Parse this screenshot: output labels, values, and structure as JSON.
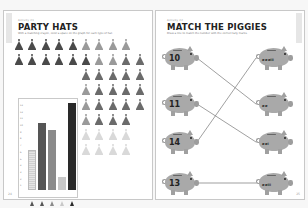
{
  "left_page": {
    "kicker": "Activity 21",
    "title": "PARTY HATS",
    "instructions": "With a matching crayon, color a space on the graph for each type of hat.",
    "page_number": "24",
    "hat_colors": {
      "dark": "#4a4a4a",
      "mid": "#6b6b6b",
      "light": "#9a9a9a",
      "faint": "#d9d9d9"
    },
    "hat_rows": [
      [
        "dark",
        "dark",
        "dark",
        "dark",
        "dark",
        "light",
        "light",
        "light",
        "light"
      ],
      [
        "dark",
        "dark",
        "dark",
        "dark",
        "dark",
        "dark",
        "light",
        "light",
        "mid",
        "mid"
      ],
      [
        "",
        "",
        "",
        "",
        "",
        "mid",
        "mid",
        "mid",
        "mid",
        "mid"
      ],
      [
        "",
        "",
        "",
        "",
        "",
        "light",
        "mid",
        "mid",
        "mid",
        "mid"
      ],
      [
        "",
        "",
        "",
        "",
        "",
        "light",
        "mid",
        "mid",
        "mid",
        "mid"
      ],
      [
        "",
        "",
        "",
        "",
        "",
        "light",
        "mid",
        "mid",
        "mid",
        ""
      ],
      [
        "",
        "",
        "",
        "",
        "",
        "faint",
        "faint",
        "faint",
        "faint",
        ""
      ],
      [
        "",
        "",
        "",
        "",
        "",
        "faint",
        "faint",
        "faint",
        "faint",
        ""
      ]
    ]
  },
  "chart_data": {
    "type": "bar",
    "title": "",
    "categories": [
      "hat-1",
      "hat-2",
      "hat-3",
      "hat-4",
      "hat-5"
    ],
    "values": [
      6,
      10,
      9,
      2,
      13
    ],
    "ylim": [
      0,
      13
    ],
    "yticks": [
      "1",
      "2",
      "3",
      "4",
      "5",
      "6",
      "7",
      "8",
      "9",
      "10",
      "11",
      "12",
      "13"
    ],
    "colors": [
      "#dcdcdc",
      "#555555",
      "#8a8a8a",
      "#c8c8c8",
      "#2a2a2a"
    ],
    "xlabel": "",
    "ylabel": "",
    "grid": false
  },
  "right_page": {
    "kicker": "Activity 22",
    "title": "MATCH THE PIGGIES",
    "instructions": "Draw a line to match the number with the correct tally marks.",
    "page_number": "25",
    "left_pigs": [
      {
        "label": "10"
      },
      {
        "label": "11"
      },
      {
        "label": "14"
      },
      {
        "label": "13"
      }
    ],
    "right_pigs": [
      {
        "tally": "𝍸 𝍸 𝍸 III"
      },
      {
        "tally": "𝍸 𝍸"
      },
      {
        "tally": "𝍸 𝍸 I"
      },
      {
        "tally": "𝍸 𝍸 III"
      }
    ],
    "matches": [
      [
        0,
        1
      ],
      [
        1,
        2
      ],
      [
        2,
        0
      ],
      [
        3,
        3
      ]
    ]
  }
}
